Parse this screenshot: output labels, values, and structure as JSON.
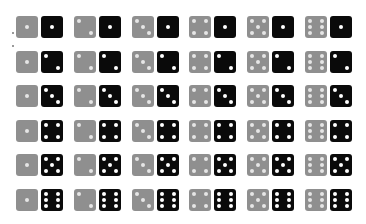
{
  "colors": {
    "gray_die": "#8f8f8f",
    "black_die": "#0a0a0a",
    "pip": "#ffffff",
    "background": "#ffffff"
  },
  "layout": {
    "rows": 6,
    "cols": 6
  },
  "grid": [
    [
      [
        1,
        1
      ],
      [
        2,
        1
      ],
      [
        3,
        1
      ],
      [
        4,
        1
      ],
      [
        5,
        1
      ],
      [
        6,
        1
      ]
    ],
    [
      [
        1,
        2
      ],
      [
        2,
        2
      ],
      [
        3,
        2
      ],
      [
        4,
        2
      ],
      [
        5,
        2
      ],
      [
        6,
        2
      ]
    ],
    [
      [
        1,
        3
      ],
      [
        2,
        3
      ],
      [
        3,
        3
      ],
      [
        4,
        3
      ],
      [
        5,
        3
      ],
      [
        6,
        3
      ]
    ],
    [
      [
        1,
        4
      ],
      [
        2,
        4
      ],
      [
        3,
        4
      ],
      [
        4,
        4
      ],
      [
        5,
        4
      ],
      [
        6,
        4
      ]
    ],
    [
      [
        1,
        5
      ],
      [
        2,
        5
      ],
      [
        3,
        5
      ],
      [
        4,
        5
      ],
      [
        5,
        5
      ],
      [
        6,
        5
      ]
    ],
    [
      [
        1,
        6
      ],
      [
        2,
        6
      ],
      [
        3,
        6
      ],
      [
        4,
        6
      ],
      [
        5,
        6
      ],
      [
        6,
        6
      ]
    ]
  ]
}
